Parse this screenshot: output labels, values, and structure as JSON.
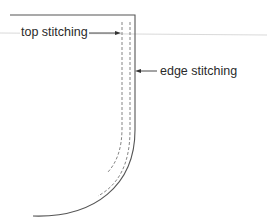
{
  "diagram": {
    "title": "",
    "labels": {
      "top_stitching": "top stitching",
      "edge_stitching": "edge stitching"
    },
    "colors": {
      "outline": "#555555",
      "dashed": "#777777",
      "guide_line": "#cfcfcf",
      "text": "#2a2a2a",
      "background": "#ffffff"
    },
    "elements": [
      {
        "id": "fabric-edge",
        "type": "solid-outline",
        "description": "Garment piece outline with straight top, straight right edge curving to bottom-left"
      },
      {
        "id": "edge-stitching-line",
        "type": "dashed-line",
        "description": "Stitching close to the edge, follows curve"
      },
      {
        "id": "top-stitching-line",
        "type": "dashed-line",
        "description": "Stitching further from edge, follows curve"
      },
      {
        "id": "guide-line",
        "type": "thin-horizontal-line"
      }
    ]
  }
}
